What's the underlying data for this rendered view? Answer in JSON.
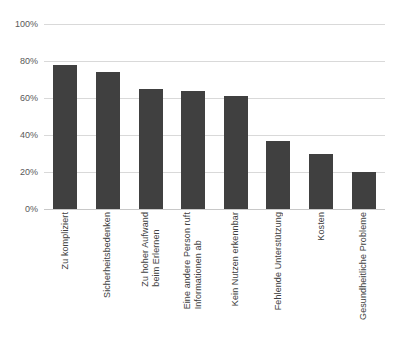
{
  "chart_data": {
    "type": "bar",
    "title": "",
    "subtitle": "",
    "xlabel": "",
    "ylabel": "",
    "ylim": [
      0,
      100
    ],
    "y_unit": "%",
    "grid": true,
    "legend": false,
    "orientation": "vertical",
    "bar_color": "#404040",
    "gridline_color": "#d9d9d9",
    "background_color": "#ffffff",
    "y_ticks": [
      "0%",
      "20%",
      "40%",
      "60%",
      "80%",
      "100%"
    ],
    "y_tick_values": [
      0,
      20,
      40,
      60,
      80,
      100
    ],
    "categories": [
      "Zu kompliziert",
      "Sicherheitsbedenken",
      "Zu hoher Aufwand\nbeim Erlernen",
      "Eine andere Person ruft\nInformationen ab",
      "Kein Nutzen erkennbar",
      "Fehlende Unterstützung",
      "Kosten",
      "Gesundheitliche Probleme"
    ],
    "values": [
      78,
      74,
      65,
      64,
      61,
      37,
      30,
      20
    ],
    "bars": [
      {
        "label": "Zu kompliziert",
        "value": 78
      },
      {
        "label": "Sicherheitsbedenken",
        "value": 74
      },
      {
        "label": "Zu hoher Aufwand\nbeim Erlernen",
        "value": 65
      },
      {
        "label": "Eine andere Person ruft\nInformationen ab",
        "value": 64
      },
      {
        "label": "Kein Nutzen erkennbar",
        "value": 61
      },
      {
        "label": "Fehlende Unterstützung",
        "value": 37
      },
      {
        "label": "Kosten",
        "value": 30
      },
      {
        "label": "Gesundheitliche Probleme",
        "value": 20
      }
    ]
  }
}
